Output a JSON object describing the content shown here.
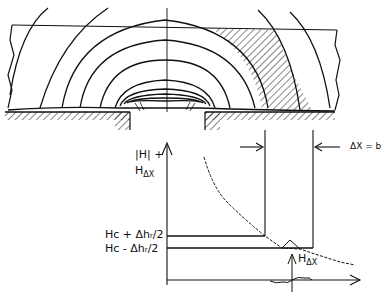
{
  "diagram": {
    "labels": {
      "field_axis_line1": "|H| +",
      "field_axis_line2_main": "H",
      "field_axis_line2_sub": "ΔX",
      "hc_plus": "Hᴄ + Δhᵣ/2",
      "hc_minus": "Hᴄ - Δhᵣ/2",
      "delta_x_eq_b": "ΔX = b",
      "h_delta_x_main": "H",
      "h_delta_x_sub": "ΔX"
    },
    "colors": {
      "ink": "#111111",
      "background": "#ffffff"
    },
    "elements": [
      "field-contour-lines",
      "recording-medium-layer",
      "hatched-transition-region",
      "head-pole-pieces",
      "gap-centerline",
      "field-magnitude-axis",
      "field-decay-curve",
      "transition-width-markers",
      "coercivity-band-lines",
      "h-delta-x-perturbation"
    ]
  }
}
